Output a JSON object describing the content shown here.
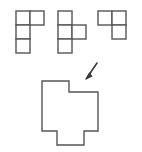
{
  "diagram": {
    "title": "Polyomino Assembly Puzzle",
    "background_color": "#ffffff",
    "stroke_color": "#555555",
    "fill_color": "#ffffff",
    "stroke_width": 1.4,
    "arrow_color": "#3b3b3b",
    "cell_size": 14,
    "pieces": [
      {
        "id": "piece-1",
        "name": "j-tetromino",
        "cell_count": 4,
        "origin": {
          "x": 16,
          "y": 11
        },
        "cells": [
          {
            "col": 0,
            "row": 0
          },
          {
            "col": 1,
            "row": 0
          },
          {
            "col": 0,
            "row": 1
          },
          {
            "col": 0,
            "row": 2
          }
        ]
      },
      {
        "id": "piece-2",
        "name": "t-tetromino",
        "cell_count": 4,
        "origin": {
          "x": 58,
          "y": 11
        },
        "cells": [
          {
            "col": 0,
            "row": 0
          },
          {
            "col": 0,
            "row": 1
          },
          {
            "col": 1,
            "row": 1
          },
          {
            "col": 0,
            "row": 2
          }
        ]
      },
      {
        "id": "piece-3",
        "name": "l-tromino",
        "cell_count": 3,
        "origin": {
          "x": 98,
          "y": 11
        },
        "cells": [
          {
            "col": 0,
            "row": 0
          },
          {
            "col": 1,
            "row": 0
          },
          {
            "col": 1,
            "row": 1
          }
        ]
      }
    ],
    "arrow": {
      "name": "down-left-arrow",
      "direction": "down-left",
      "start": {
        "x": 97,
        "y": 63
      },
      "end": {
        "x": 85,
        "y": 80
      },
      "head_points": "85,80 92.6,76.4 89.3,72.1"
    },
    "target": {
      "id": "target-shape",
      "name": "assembled-cross-polygon",
      "cell_count": 11,
      "points": "42,81 69,81 69,92 98,92 98,131 84,131 84,145 57,145 57,131 42,131"
    }
  }
}
